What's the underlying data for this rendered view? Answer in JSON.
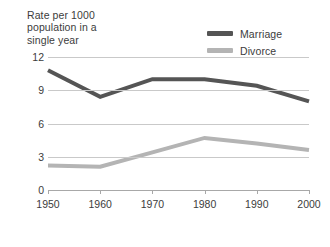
{
  "chart_data": {
    "type": "line",
    "title": "Rate per 1000\npopulation in a\nsingle year",
    "xlabel": "",
    "ylabel": "",
    "x": [
      1950,
      1960,
      1970,
      1980,
      1990,
      2000
    ],
    "categories": [
      "1950",
      "1960",
      "1970",
      "1980",
      "1990",
      "2000"
    ],
    "series": [
      {
        "name": "Marriage",
        "color": "#555555",
        "values": [
          10.8,
          8.4,
          10.0,
          10.0,
          9.4,
          8.0
        ]
      },
      {
        "name": "Divorce",
        "color": "#b4b4b4",
        "values": [
          2.2,
          2.1,
          3.4,
          4.7,
          4.2,
          3.6
        ]
      }
    ],
    "ylim": [
      0,
      12
    ],
    "yticks": [
      0,
      3,
      6,
      9,
      12
    ],
    "ytick_labels": [
      "0",
      "3",
      "6",
      "9",
      "12"
    ],
    "xlim": [
      1950,
      2000
    ],
    "grid": true,
    "legend_position": "top-right"
  },
  "legend": {
    "items": [
      {
        "label": "Marriage",
        "color": "#555555"
      },
      {
        "label": "Divorce",
        "color": "#b4b4b4"
      }
    ]
  },
  "axes": {
    "y_title": "Rate per 1000\npopulation in a\nsingle year"
  }
}
